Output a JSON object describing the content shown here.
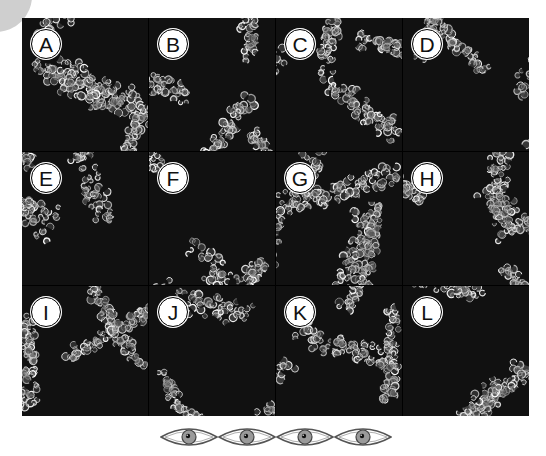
{
  "figure": {
    "panels": [
      {
        "label": "A",
        "seed": 11,
        "density": 0.62
      },
      {
        "label": "B",
        "seed": 23,
        "density": 0.66
      },
      {
        "label": "C",
        "seed": 37,
        "density": 0.72
      },
      {
        "label": "D",
        "seed": 41,
        "density": 0.6
      },
      {
        "label": "E",
        "seed": 53,
        "density": 0.64
      },
      {
        "label": "F",
        "seed": 67,
        "density": 0.62
      },
      {
        "label": "G",
        "seed": 71,
        "density": 0.66
      },
      {
        "label": "H",
        "seed": 83,
        "density": 0.68
      },
      {
        "label": "I",
        "seed": 97,
        "density": 0.6
      },
      {
        "label": "J",
        "seed": 101,
        "density": 0.62
      },
      {
        "label": "K",
        "seed": 113,
        "density": 0.58
      },
      {
        "label": "L",
        "seed": 127,
        "density": 0.7
      }
    ],
    "rating": {
      "icon": "eye-icon",
      "count": 4
    },
    "colors": {
      "panel_background": "#111111",
      "leaf_stroke": "#e8e8e8",
      "label_fill": "#ffffff",
      "label_border": "#000000",
      "eye_iris": "#9a9a9a",
      "eye_outline": "#555555"
    }
  }
}
